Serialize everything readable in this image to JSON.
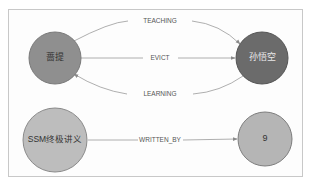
{
  "graph": {
    "nodes": [
      {
        "id": "n1",
        "label": "蔷提",
        "cx": 55,
        "cy": 58,
        "r": 26,
        "fill": "#8f8f8f",
        "stroke": "#7a7a7a"
      },
      {
        "id": "n2",
        "label": "孙悟空",
        "cx": 262,
        "cy": 58,
        "r": 26,
        "fill": "#6b6b6b",
        "stroke": "#555555"
      },
      {
        "id": "n3",
        "label": "SSM终极讲义",
        "cx": 55,
        "cy": 139,
        "r": 32,
        "fill": "#bdbdbd",
        "stroke": "#8a8a8a"
      },
      {
        "id": "n4",
        "label": "9",
        "cx": 265,
        "cy": 139,
        "r": 27,
        "fill": "#b5b5b5",
        "stroke": "#7d7d7d"
      }
    ],
    "edges": [
      {
        "id": "e1",
        "label": "TEACHING",
        "from": "n1",
        "to": "n2"
      },
      {
        "id": "e2",
        "label": "EVICT",
        "from": "n1",
        "to": "n2"
      },
      {
        "id": "e3",
        "label": "LEARNING",
        "from": "n2",
        "to": "n1"
      },
      {
        "id": "e4",
        "label": "WRITTEN_BY",
        "from": "n3",
        "to": "n4"
      }
    ]
  }
}
